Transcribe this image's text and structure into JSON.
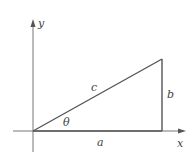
{
  "diagram": {
    "type": "right-triangle-on-axes",
    "axes": {
      "x_label": "x",
      "y_label": "y"
    },
    "triangle": {
      "hypotenuse_label": "c",
      "adjacent_label": "a",
      "opposite_label": "b",
      "angle_label": "θ"
    },
    "colors": {
      "lines": "#555555",
      "axes": "#666666",
      "labels": "#444444",
      "background": "#ffffff"
    }
  }
}
